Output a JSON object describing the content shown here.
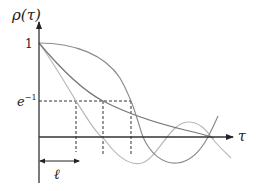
{
  "diagram": {
    "y_axis": {
      "label": "ρ(τ)",
      "tick_one": "1",
      "tick_einv_base": "e",
      "tick_einv_exp": "−1"
    },
    "x_axis": {
      "label": "τ"
    },
    "length_marker": {
      "label": "ℓ"
    },
    "colors": {
      "axis": "#333333",
      "dashed": "#333333",
      "curve_fast": "#b8b8b8",
      "curve_exp": "#777777",
      "curve_gauss": "#9a9a9a"
    },
    "curves": [
      {
        "name": "fast-oscillating-correlation",
        "crosses_einv_at_px": 76
      },
      {
        "name": "exponential-decay-correlation",
        "crosses_einv_at_px": 103
      },
      {
        "name": "gaussian-like-correlation",
        "crosses_einv_at_px": 131
      }
    ]
  }
}
